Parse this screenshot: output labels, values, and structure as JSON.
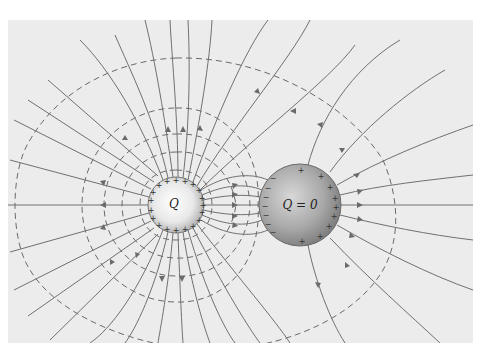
{
  "figure": {
    "background_color": "#ececec",
    "line_color": "#707070"
  },
  "charged_sphere": {
    "label": "Q",
    "induced_sign": "+",
    "center": [
      176,
      205
    ],
    "radius": 28
  },
  "neutral_sphere": {
    "label": "Q = 0",
    "left_sign": "−",
    "right_sign": "+",
    "center": [
      300,
      205
    ],
    "radius": 41
  },
  "legend": {
    "field_lines": "solid lines with arrows",
    "equipotentials": "dashed lines"
  }
}
